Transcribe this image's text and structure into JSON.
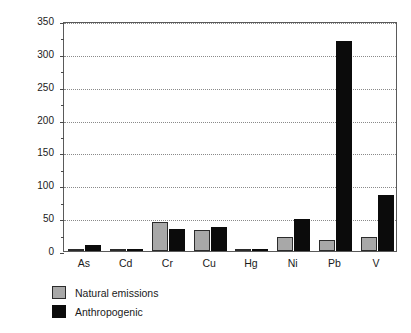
{
  "chart_data": {
    "type": "bar",
    "title": "",
    "xlabel": "",
    "ylabel": "Emissions (millions of kg yr",
    "ylabel_sup": "-1",
    "ylabel_tail": ")",
    "categories": [
      "As",
      "Cd",
      "Cr",
      "Cu",
      "Hg",
      "Ni",
      "Pb",
      "V"
    ],
    "series": [
      {
        "name": "Natural emissions",
        "color": "#a8a8a8",
        "values": [
          3,
          1,
          44,
          32,
          1,
          22,
          17,
          21
        ]
      },
      {
        "name": "Anthropogenic",
        "color": "#0b0b0b",
        "values": [
          9,
          3,
          33,
          37,
          2,
          48,
          320,
          86
        ]
      }
    ],
    "ylim": [
      0,
      350
    ],
    "ytick_values": [
      0,
      50,
      100,
      150,
      200,
      250,
      300,
      350
    ],
    "ytick_labels": [
      "0",
      "50",
      "100",
      "150",
      "200",
      "250",
      "300",
      "350"
    ],
    "grid": true,
    "legend_position": "below-left"
  },
  "legend": {
    "entries": [
      {
        "label": "Natural emissions",
        "swatch": "natural"
      },
      {
        "label": "Anthropogenic",
        "swatch": "anthro"
      }
    ]
  },
  "colors": {
    "natural": "#a8a8a8",
    "anthropogenic": "#0b0b0b",
    "axis": "#5a5a5a",
    "grid": "#8a8a8a",
    "text": "#1a1a1a",
    "background": "#ffffff"
  }
}
